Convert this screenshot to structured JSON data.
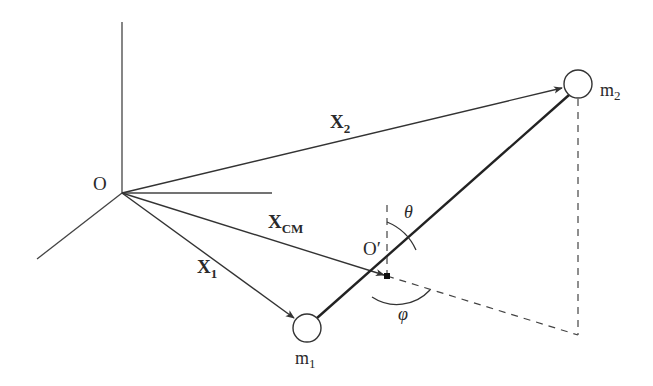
{
  "diagram": {
    "type": "two-body center-of-mass geometry",
    "colors": {
      "stroke": "#333333",
      "background": "#ffffff"
    },
    "origin": {
      "label": "O"
    },
    "center_of_mass_point": {
      "label": "O′"
    },
    "masses": [
      {
        "id": "m1",
        "label": "m",
        "subscript": "1"
      },
      {
        "id": "m2",
        "label": "m",
        "subscript": "2"
      }
    ],
    "vectors": [
      {
        "id": "X1",
        "label": "X",
        "subscript": "1",
        "from": "O",
        "to": "m1"
      },
      {
        "id": "X2",
        "label": "X",
        "subscript": "2",
        "from": "O",
        "to": "m2"
      },
      {
        "id": "XCM",
        "label": "X",
        "subscript": "CM",
        "from": "O",
        "to": "O′"
      }
    ],
    "angles": [
      {
        "id": "theta",
        "label": "θ",
        "description": "polar angle from vertical"
      },
      {
        "id": "phi",
        "label": "φ",
        "description": "azimuthal angle in horizontal plane"
      }
    ],
    "axes": {
      "count": 3,
      "labels": []
    }
  }
}
